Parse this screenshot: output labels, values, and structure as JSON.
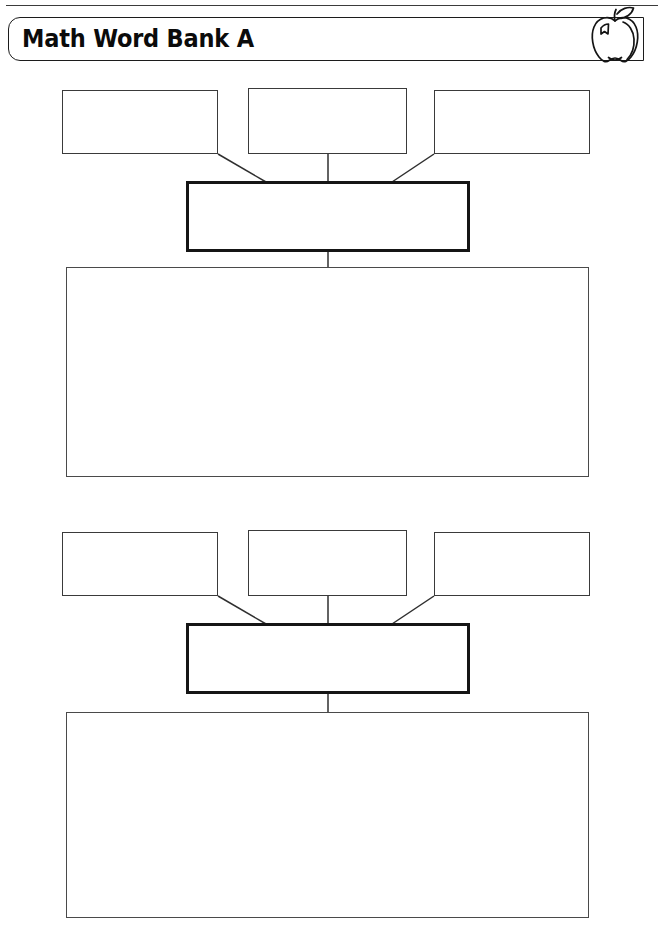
{
  "page": {
    "title": "Math Word Bank A",
    "width": 664,
    "height": 945,
    "background": "#ffffff",
    "line_color": "#3a3a3a",
    "bold_line_color": "#151515",
    "text_color": "#0b0b0b"
  },
  "header": {
    "title": "Math Word Bank A",
    "icon": "apple-icon",
    "has_top_rule": true
  },
  "groups": [
    {
      "id": "group-1",
      "top_boxes": [
        {
          "label": "",
          "x": 62,
          "y": 90,
          "w": 156,
          "h": 64
        },
        {
          "label": "",
          "x": 248,
          "y": 88,
          "w": 159,
          "h": 66
        },
        {
          "label": "",
          "x": 434,
          "y": 90,
          "w": 156,
          "h": 64
        }
      ],
      "center_box": {
        "label": "",
        "x": 186,
        "y": 181,
        "w": 284,
        "h": 71,
        "emphasis": "bold"
      },
      "main_box": {
        "label": "",
        "x": 66,
        "y": 267,
        "w": 523,
        "h": 210
      }
    },
    {
      "id": "group-2",
      "top_boxes": [
        {
          "label": "",
          "x": 62,
          "y": 532,
          "w": 156,
          "h": 64
        },
        {
          "label": "",
          "x": 248,
          "y": 530,
          "w": 159,
          "h": 66
        },
        {
          "label": "",
          "x": 434,
          "y": 532,
          "w": 156,
          "h": 64
        }
      ],
      "center_box": {
        "label": "",
        "x": 186,
        "y": 623,
        "w": 284,
        "h": 71,
        "emphasis": "bold"
      },
      "main_box": {
        "label": "",
        "x": 66,
        "y": 712,
        "w": 523,
        "h": 206
      }
    }
  ],
  "connectors": {
    "group_1": {
      "left_diagonal": "M218,154 L266,182",
      "center_vertical": "M328,154 L328,182",
      "right_diagonal": "M434,154 L392,182",
      "stem_to_main": "M328,252 L328,267"
    },
    "group_2": {
      "left_diagonal": "M218,596 L266,623",
      "center_vertical": "M328,596 L328,623",
      "right_diagonal": "M434,596 L392,623",
      "stem_to_main": "M328,694 L328,712"
    }
  }
}
